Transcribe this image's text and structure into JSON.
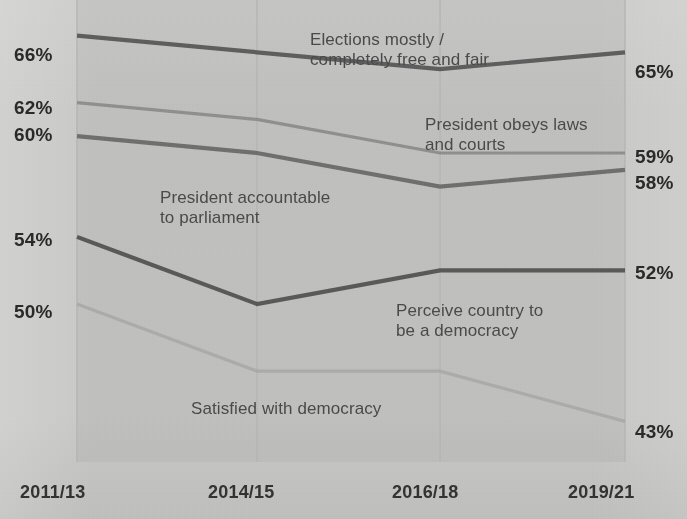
{
  "chart_data": {
    "type": "line",
    "title": "",
    "xlabel": "",
    "ylabel": "",
    "categories": [
      "2011/13",
      "2014/15",
      "2016/18",
      "2019/21"
    ],
    "ylim": [
      41,
      68
    ],
    "grid": "vertical-gridlines-at-each-category",
    "legend": "inline-labels-next-to-lines",
    "y_axis_left_ticks": [
      "66%",
      "62%",
      "60%",
      "54%",
      "50%"
    ],
    "y_axis_right_ticks": [
      "65%",
      "59%",
      "58%",
      "52%",
      "43%"
    ],
    "series": [
      {
        "name": "Elections mostly / completely free and fair",
        "values": [
          66,
          65,
          64,
          65
        ],
        "start_label": "66%",
        "end_label": "65%",
        "color": "#5e5e5e"
      },
      {
        "name": "President obeys laws and courts",
        "values": [
          62,
          61,
          59,
          59
        ],
        "start_label": "62%",
        "end_label": "59%",
        "color": "#8a8a88"
      },
      {
        "name": "President accountable to parliament",
        "values": [
          60,
          59,
          57,
          58
        ],
        "start_label": "60%",
        "end_label": "58%",
        "color": "#6f6f6d"
      },
      {
        "name": "Perceive country to be a democracy",
        "values": [
          54,
          50,
          52,
          52
        ],
        "start_label": "54%",
        "end_label": "52%",
        "color": "#595957"
      },
      {
        "name": "Satisfied with democracy",
        "values": [
          50,
          46,
          46,
          43
        ],
        "start_label": "50%",
        "end_label": "43%",
        "color": "#a7a7a4"
      }
    ]
  },
  "axis": {
    "left": [
      {
        "text": "66%",
        "top": 44
      },
      {
        "text": "62%",
        "top": 97
      },
      {
        "text": "60%",
        "top": 124
      },
      {
        "text": "54%",
        "top": 229
      },
      {
        "text": "50%",
        "top": 301
      }
    ],
    "right": [
      {
        "text": "65%",
        "top": 61
      },
      {
        "text": "59%",
        "top": 146
      },
      {
        "text": "58%",
        "top": 172
      },
      {
        "text": "52%",
        "top": 262
      },
      {
        "text": "43%",
        "top": 421
      }
    ],
    "x": [
      {
        "text": "2011/13",
        "left": 20
      },
      {
        "text": "2014/15",
        "left": 208
      },
      {
        "text": "2016/18",
        "left": 392
      },
      {
        "text": "2019/21",
        "left": 568
      }
    ]
  },
  "annotations": [
    {
      "text": "Elections mostly /\ncompletely free and fair",
      "left": 310,
      "top": 30
    },
    {
      "text": "President obeys laws\nand courts",
      "left": 425,
      "top": 115
    },
    {
      "text": "President accountable\nto parliament",
      "left": 160,
      "top": 188
    },
    {
      "text": "Perceive country to\nbe a democracy",
      "left": 396,
      "top": 301
    },
    {
      "text": "Satisfied with democracy",
      "left": 191,
      "top": 399
    }
  ],
  "colors": {
    "background": "#c8c8c6",
    "panel": "#c3c3c1",
    "gridline": "#b5b5b3",
    "axis_text": "#2a2a2a",
    "annotation_text": "#4a4a4a"
  }
}
